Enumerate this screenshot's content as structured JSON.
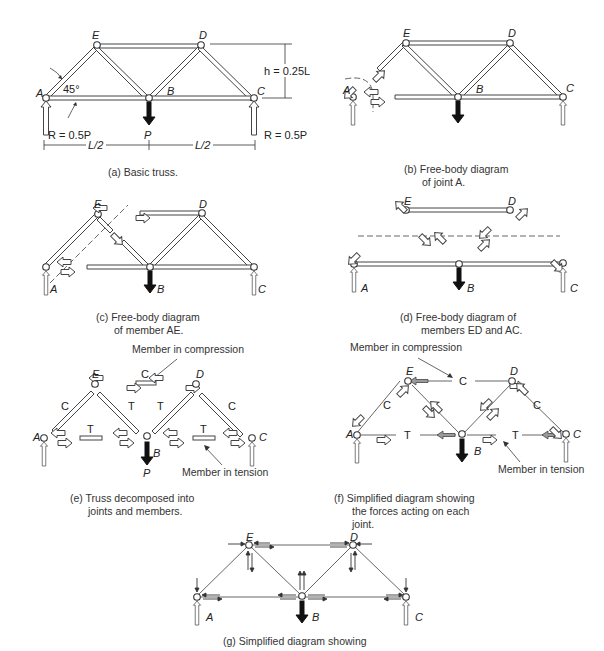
{
  "figure": {
    "joints": [
      "A",
      "B",
      "C",
      "D",
      "E"
    ],
    "panels": {
      "a": {
        "caption_line1": "(a)  Basic truss.",
        "labels": {
          "A": "A",
          "B": "B",
          "C": "C",
          "D": "D",
          "E": "E"
        },
        "angle": "45°",
        "height": "h = 0.25L",
        "reaction_left": "R = 0.5P",
        "reaction_right": "R = 0.5P",
        "load": "P",
        "span_left": "L/2",
        "span_right": "L/2"
      },
      "b": {
        "caption_line1": "(b)  Free-body diagram",
        "caption_line2": "of joint A.",
        "labels": {
          "A": "A",
          "B": "B",
          "C": "C",
          "D": "D",
          "E": "E"
        }
      },
      "c": {
        "caption_line1": "(c)  Free-body diagram",
        "caption_line2": "of member AE.",
        "labels": {
          "A": "A",
          "B": "B",
          "C": "C",
          "D": "D",
          "E": "E"
        }
      },
      "d": {
        "caption_line1": "(d)  Free-body diagram of",
        "caption_line2": "members ED and AC.",
        "labels": {
          "A": "A",
          "B": "B",
          "C": "C",
          "D": "D",
          "E": "E"
        }
      },
      "e": {
        "caption_line1": "(e)  Truss decomposed into",
        "caption_line2": "joints and members.",
        "labels": {
          "A": "A",
          "B": "B",
          "C": "C",
          "D": "D",
          "E": "E",
          "P": "P"
        },
        "compression_note": "Member in compression",
        "tension_note": "Member in tension",
        "member_forces": {
          "ED": "C",
          "AE": "C",
          "DC": "C",
          "EB": "T",
          "BD": "T",
          "AB": "T",
          "BC": "T"
        }
      },
      "f": {
        "caption_line1": "(f)  Simplified diagram showing",
        "caption_line2": "the forces acting on each",
        "caption_line3": "joint.",
        "labels": {
          "A": "A",
          "B": "B",
          "C": "C",
          "D": "D",
          "E": "E"
        },
        "compression_note": "Member in compression",
        "tension_note": "Member in tension",
        "member_forces": {
          "ED": "C",
          "AE": "C",
          "DC": "C",
          "EB": "T",
          "BD": "T",
          "AB": "T",
          "BC": "T"
        }
      },
      "g": {
        "caption_line1": "(g)  Simplified diagram showing",
        "labels": {
          "A": "A",
          "B": "B",
          "C": "C",
          "D": "D",
          "E": "E"
        }
      }
    }
  }
}
